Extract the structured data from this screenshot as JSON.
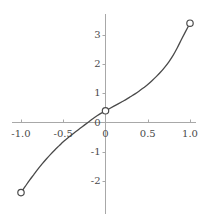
{
  "chart_data": {
    "type": "line",
    "title": "",
    "subtitle": "",
    "xlabel": "",
    "ylabel": "",
    "xlim": [
      -1.12,
      1.12
    ],
    "ylim": [
      -2.85,
      3.85
    ],
    "grid": false,
    "legend": null,
    "xticks": [
      -1.0,
      -0.5,
      0,
      0.5,
      1.0
    ],
    "xtick_labels": [
      "-1.0",
      "-0.5",
      "0",
      "0.5",
      "1.0"
    ],
    "yticks": [
      3,
      2,
      1,
      0,
      -1,
      -2
    ],
    "ytick_labels": [
      "3",
      "2",
      "1",
      "0",
      "-1",
      "-2"
    ],
    "axis_color": "#a8a8a8",
    "curve_color": "#4a4a4a",
    "marker_style": "open-circle",
    "series": [
      {
        "name": "curve",
        "x": [
          -1.0,
          -0.95,
          -0.9,
          -0.85,
          -0.8,
          -0.75,
          -0.7,
          -0.65,
          -0.6,
          -0.55,
          -0.5,
          -0.45,
          -0.4,
          -0.35,
          -0.3,
          -0.25,
          -0.2,
          -0.15,
          -0.1,
          -0.05,
          0.0,
          0.05,
          0.1,
          0.15,
          0.2,
          0.25,
          0.3,
          0.35,
          0.4,
          0.45,
          0.5,
          0.55,
          0.6,
          0.65,
          0.7,
          0.75,
          0.8,
          0.85,
          0.9,
          0.95,
          1.0
        ],
        "y": [
          -2.4,
          -2.19,
          -1.98,
          -1.79,
          -1.6,
          -1.42,
          -1.25,
          -1.09,
          -0.94,
          -0.8,
          -0.66,
          -0.54,
          -0.42,
          -0.31,
          -0.2,
          -0.09,
          0.02,
          0.13,
          0.23,
          0.32,
          0.4,
          0.48,
          0.56,
          0.64,
          0.72,
          0.8,
          0.89,
          0.98,
          1.08,
          1.19,
          1.3,
          1.43,
          1.57,
          1.72,
          1.89,
          2.08,
          2.3,
          2.56,
          2.85,
          3.13,
          3.4
        ]
      }
    ],
    "markers": [
      {
        "name": "left-endpoint",
        "x": -1.0,
        "y": -2.4,
        "filled": false
      },
      {
        "name": "origin-point",
        "x": 0.0,
        "y": 0.4,
        "filled": false
      },
      {
        "name": "right-endpoint",
        "x": 1.0,
        "y": 3.4,
        "filled": false
      }
    ]
  }
}
